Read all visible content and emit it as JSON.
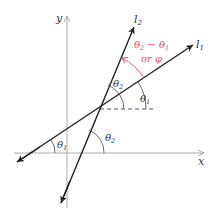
{
  "diagram": {
    "axes": {
      "x_label": "x",
      "y_label": "y",
      "axis_color": "#aaaaaa"
    },
    "lines": [
      {
        "name": "l1",
        "label_base": "l",
        "label_sub": "1"
      },
      {
        "name": "l2",
        "label_base": "l",
        "label_sub": "2"
      }
    ],
    "angles": {
      "theta1_top": {
        "base": "θ",
        "sub": "1"
      },
      "theta2_top": {
        "base": "θ",
        "sub": "2"
      },
      "theta1_bottom": {
        "base": "θ",
        "sub": "1"
      },
      "theta2_bottom": {
        "base": "θ",
        "sub": "2"
      }
    },
    "difference_annotation": {
      "line1_a": "θ",
      "line1_a_sub": "2",
      "line1_op": " − ",
      "line1_b": "θ",
      "line1_b_sub": "1",
      "line2": "or φ",
      "color": "#e8476a"
    },
    "line_color": "#222222"
  }
}
